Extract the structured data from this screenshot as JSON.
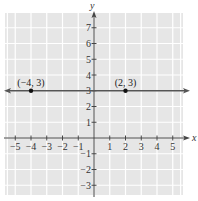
{
  "chart_data": {
    "type": "line",
    "title": "",
    "xlabel": "x",
    "ylabel": "y",
    "xlim": [
      -5.5,
      5.7
    ],
    "ylim": [
      -3.6,
      7.8
    ],
    "grid": true,
    "x_ticks": [
      -5,
      -4,
      -3,
      -2,
      -1,
      1,
      2,
      3,
      4,
      5
    ],
    "x_tick_labels": [
      "−5",
      "−4",
      "−3",
      "−2",
      "−1",
      "1",
      "2",
      "3",
      "4",
      "5"
    ],
    "y_ticks": [
      -3,
      -2,
      -1,
      1,
      2,
      3,
      4,
      5,
      6,
      7
    ],
    "y_tick_labels": [
      "−3",
      "−2",
      "−1",
      "1",
      "2",
      "3",
      "4",
      "5",
      "6",
      "7"
    ],
    "series": [
      {
        "name": "y = 3",
        "kind": "horizontal-line",
        "y": 3,
        "arrows": "both",
        "color": "#555555"
      }
    ],
    "points": [
      {
        "x": -4,
        "y": 3,
        "label": "(−4, 3)"
      },
      {
        "x": 2,
        "y": 3,
        "label": "(2, 3)"
      }
    ],
    "colors": {
      "grid_background": "#e6e6e6",
      "grid_lines": "#ffffff",
      "axis": "#444444",
      "point": "#111111"
    }
  }
}
